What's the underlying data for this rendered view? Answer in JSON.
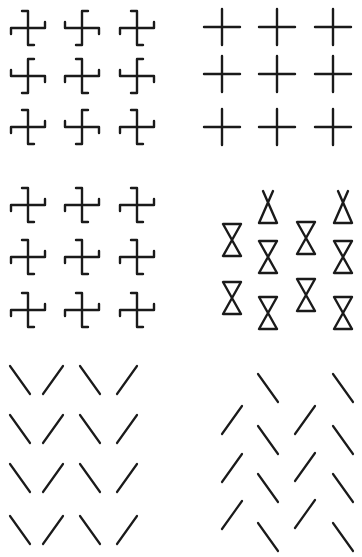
{
  "figure": {
    "ink_color": "#1a1a1a",
    "background_color": "#ffffff",
    "panels": [
      {
        "id": "pinwheel-checkerboard",
        "element": "pinwheel",
        "rows": [
          [
            "A",
            "B",
            "A"
          ],
          [
            "B",
            "A",
            "B"
          ],
          [
            "A",
            "B",
            "A"
          ]
        ]
      },
      {
        "id": "plain-crosses",
        "element": "cross",
        "rows": [
          [
            "plus",
            "plus",
            "plus"
          ],
          [
            "plus",
            "plus",
            "plus"
          ],
          [
            "plus",
            "plus",
            "plus"
          ]
        ]
      },
      {
        "id": "pinwheel-uniform",
        "element": "pinwheel",
        "rows": [
          [
            "A",
            "A",
            "A"
          ],
          [
            "A",
            "A",
            "A"
          ],
          [
            "A",
            "A",
            "A"
          ]
        ]
      },
      {
        "id": "hourglasses",
        "element": "hourglass",
        "columns": [
          [
            "closed",
            "closed"
          ],
          [
            "open-top",
            "closed",
            "closed"
          ],
          [
            "closed",
            "closed"
          ],
          [
            "open-top",
            "closed",
            "closed"
          ]
        ]
      },
      {
        "id": "v-lines",
        "element": "line",
        "rows": [
          [
            "backslash",
            "slash",
            "backslash",
            "slash"
          ],
          [
            "backslash",
            "slash",
            "backslash",
            "slash"
          ],
          [
            "backslash",
            "slash",
            "backslash",
            "slash"
          ],
          [
            "backslash",
            "slash",
            "backslash",
            "slash"
          ]
        ]
      },
      {
        "id": "herringbone-lines",
        "element": "line",
        "columns": [
          [
            "slash",
            "slash",
            "slash"
          ],
          [
            "backslash",
            "backslash",
            "backslash",
            "backslash"
          ],
          [
            "slash",
            "slash",
            "slash"
          ],
          [
            "backslash",
            "backslash",
            "backslash",
            "backslash"
          ]
        ]
      }
    ]
  }
}
